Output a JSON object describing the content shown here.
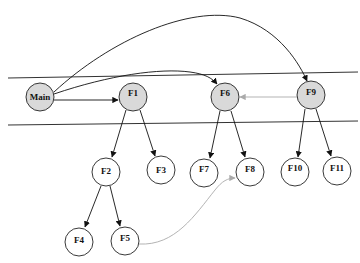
{
  "diagram": {
    "type": "call-graph",
    "bands": [
      {
        "name": "band-top-line",
        "x1": 8,
        "y1": 78,
        "x2": 358,
        "y2": 72
      },
      {
        "name": "band-bottom-line",
        "x1": 8,
        "y1": 125,
        "x2": 358,
        "y2": 121
      }
    ],
    "nodes": [
      {
        "id": "Main",
        "label": "Main",
        "x": 40,
        "y": 97,
        "fill": "#d9d9d9"
      },
      {
        "id": "F1",
        "label": "F1",
        "x": 133,
        "y": 97,
        "fill": "#d9d9d9"
      },
      {
        "id": "F6",
        "label": "F6",
        "x": 225,
        "y": 97,
        "fill": "#d9d9d9"
      },
      {
        "id": "F9",
        "label": "F9",
        "x": 311,
        "y": 95,
        "fill": "#d9d9d9"
      },
      {
        "id": "F2",
        "label": "F2",
        "x": 106,
        "y": 172,
        "fill": "#ffffff"
      },
      {
        "id": "F3",
        "label": "F3",
        "x": 161,
        "y": 170,
        "fill": "#ffffff"
      },
      {
        "id": "F7",
        "label": "F7",
        "x": 204,
        "y": 173,
        "fill": "#ffffff"
      },
      {
        "id": "F8",
        "label": "F8",
        "x": 250,
        "y": 172,
        "fill": "#ffffff"
      },
      {
        "id": "F10",
        "label": "F10",
        "x": 295,
        "y": 172,
        "fill": "#ffffff"
      },
      {
        "id": "F11",
        "label": "F11",
        "x": 337,
        "y": 171,
        "fill": "#ffffff"
      },
      {
        "id": "F4",
        "label": "F4",
        "x": 79,
        "y": 242,
        "fill": "#ffffff"
      },
      {
        "id": "F5",
        "label": "F5",
        "x": 125,
        "y": 241,
        "fill": "#ffffff"
      }
    ],
    "edges": [
      {
        "from": "Main",
        "to": "F1",
        "style": "solid",
        "color": "#111111"
      },
      {
        "from": "Main",
        "to": "F6",
        "style": "curve",
        "color": "#111111"
      },
      {
        "from": "Main",
        "to": "F9",
        "style": "curve",
        "color": "#111111"
      },
      {
        "from": "F9",
        "to": "F6",
        "style": "solid",
        "color": "#aaaaaa"
      },
      {
        "from": "F1",
        "to": "F2",
        "style": "solid",
        "color": "#111111"
      },
      {
        "from": "F1",
        "to": "F3",
        "style": "solid",
        "color": "#111111"
      },
      {
        "from": "F2",
        "to": "F4",
        "style": "solid",
        "color": "#111111"
      },
      {
        "from": "F2",
        "to": "F5",
        "style": "solid",
        "color": "#111111"
      },
      {
        "from": "F6",
        "to": "F7",
        "style": "solid",
        "color": "#111111"
      },
      {
        "from": "F6",
        "to": "F8",
        "style": "solid",
        "color": "#111111"
      },
      {
        "from": "F9",
        "to": "F10",
        "style": "solid",
        "color": "#111111"
      },
      {
        "from": "F9",
        "to": "F11",
        "style": "solid",
        "color": "#111111"
      },
      {
        "from": "F5",
        "to": "F8",
        "style": "curve",
        "color": "#aaaaaa"
      }
    ],
    "labels": {
      "Main": "Main",
      "F1": "F1",
      "F2": "F2",
      "F3": "F3",
      "F4": "F4",
      "F5": "F5",
      "F6": "F6",
      "F7": "F7",
      "F8": "F8",
      "F9": "F9",
      "F10": "F10",
      "F11": "F11"
    },
    "colors": {
      "highlight_fill": "#d9d9d9",
      "plain_fill": "#ffffff",
      "stroke": "#222222",
      "secondary_edge": "#aaaaaa"
    }
  }
}
